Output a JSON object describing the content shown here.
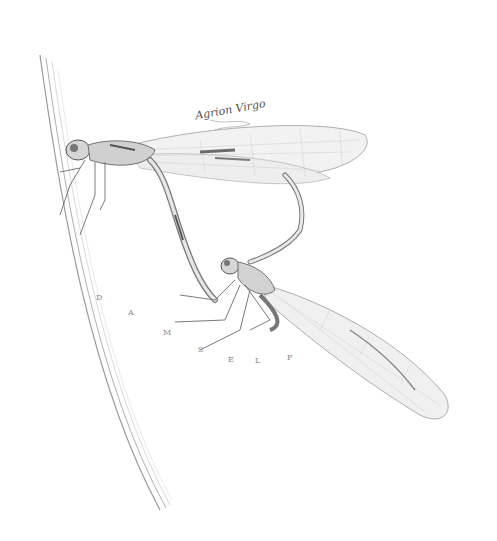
{
  "image": {
    "description": "Pencil illustration of a mating pair of damselflies perched on a grass stem",
    "caption": "Agrion Virgo",
    "arc_letters": [
      "D",
      "A",
      "M",
      "S",
      "E",
      "L",
      "F"
    ],
    "colors": {
      "background": "#ffffff",
      "line": "#6b6b6b",
      "shade": "#9a9a9a",
      "light": "#c8c8c8"
    }
  }
}
